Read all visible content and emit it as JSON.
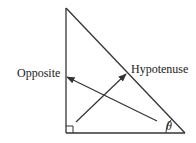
{
  "diagram": {
    "labels": {
      "opposite": "Opposite",
      "hypotenuse": "Hypotenuse",
      "angle": "θ"
    },
    "colors": {
      "stroke": "#333333",
      "text": "#222222",
      "background": "#ffffff"
    },
    "vertices": {
      "top": [
        66,
        8
      ],
      "right_angle": [
        66,
        133
      ],
      "theta_vertex": [
        185,
        133
      ]
    },
    "arrows": [
      {
        "name": "to-opposite",
        "from": [
          157,
          121
        ],
        "to": [
          67,
          77
        ]
      },
      {
        "name": "to-hypotenuse",
        "from": [
          76,
          122
        ],
        "to": [
          126,
          74
        ]
      }
    ]
  }
}
